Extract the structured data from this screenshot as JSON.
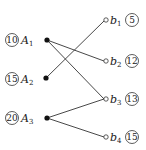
{
  "diagram": {
    "type": "bipartite-graph",
    "left_nodes": [
      {
        "id": "A1",
        "name": "A",
        "sub": "1",
        "value": "10",
        "x": 47,
        "y": 40,
        "marker": "filled"
      },
      {
        "id": "A2",
        "name": "A",
        "sub": "2",
        "value": "15",
        "x": 46,
        "y": 78,
        "marker": "filled"
      },
      {
        "id": "A3",
        "name": "A",
        "sub": "3",
        "value": "20",
        "x": 47,
        "y": 118,
        "marker": "filled"
      }
    ],
    "right_nodes": [
      {
        "id": "b1",
        "name": "b",
        "sub": "1",
        "value": "5",
        "x": 106,
        "y": 20,
        "marker": "hollow"
      },
      {
        "id": "b2",
        "name": "b",
        "sub": "2",
        "value": "12",
        "x": 106,
        "y": 61,
        "marker": "hollow"
      },
      {
        "id": "b3",
        "name": "b",
        "sub": "3",
        "value": "13",
        "x": 106,
        "y": 99,
        "marker": "hollow"
      },
      {
        "id": "b4",
        "name": "b",
        "sub": "4",
        "value": "15",
        "x": 106,
        "y": 137,
        "marker": "hollow"
      }
    ],
    "edges": [
      {
        "from": "A1",
        "to": "b2"
      },
      {
        "from": "A1",
        "to": "b3"
      },
      {
        "from": "A2",
        "to": "b1"
      },
      {
        "from": "A3",
        "to": "b3"
      },
      {
        "from": "A3",
        "to": "b4"
      }
    ]
  }
}
